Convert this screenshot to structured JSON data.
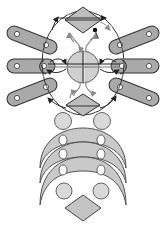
{
  "diagram": {
    "title": "",
    "colors": {
      "background": "#ffffff",
      "fill_dark": "#a9a9a9",
      "fill_light": "#cfcfcf",
      "fill_lighter": "#d9d9d9",
      "stroke": "#333333",
      "arrow_dark": "#222222",
      "arrow_grey": "#8a8a8a",
      "hole": "#ffffff",
      "dot": "#000000"
    },
    "top_diamond": {
      "cx": 83,
      "cy": 20,
      "w": 36,
      "h": 26
    },
    "center_circle": {
      "cx": 83,
      "cy": 67,
      "r": 16
    },
    "outer_ring": {
      "cx": 83,
      "cy": 63,
      "rx": 42,
      "ry": 54
    },
    "left_pills": [
      {
        "x1": 14,
        "y1": 33,
        "x2": 50,
        "y2": 47
      },
      {
        "x1": 14,
        "y1": 66,
        "x2": 48,
        "y2": 66
      },
      {
        "x1": 14,
        "y1": 99,
        "x2": 50,
        "y2": 85
      }
    ],
    "right_pills": [
      {
        "x1": 152,
        "y1": 33,
        "x2": 116,
        "y2": 47
      },
      {
        "x1": 152,
        "y1": 66,
        "x2": 118,
        "y2": 66
      },
      {
        "x1": 152,
        "y1": 99,
        "x2": 116,
        "y2": 85
      }
    ],
    "lower_diamond": {
      "cx": 83,
      "cy": 105,
      "w": 34,
      "h": 24
    },
    "upper_circles": [
      {
        "cx": 63,
        "cy": 121,
        "r": 9
      },
      {
        "cx": 102,
        "cy": 121,
        "r": 9
      }
    ],
    "crescents": [
      {
        "top": 128,
        "bottom_tip": 168
      },
      {
        "top": 142,
        "bottom_tip": 183
      },
      {
        "top": 157,
        "bottom_tip": 198
      }
    ],
    "crescent_holes": [
      {
        "cx": 63,
        "cy": 140
      },
      {
        "cx": 101,
        "cy": 140
      },
      {
        "cx": 63,
        "cy": 154
      },
      {
        "cx": 101,
        "cy": 154
      },
      {
        "cx": 63,
        "cy": 170
      },
      {
        "cx": 101,
        "cy": 170
      }
    ],
    "lower_circles": [
      {
        "cx": 64,
        "cy": 191,
        "r": 8
      },
      {
        "cx": 101,
        "cy": 191,
        "r": 8
      }
    ],
    "bottom_diamond": {
      "cx": 83,
      "cy": 207,
      "w": 36,
      "h": 26
    },
    "labels": []
  }
}
